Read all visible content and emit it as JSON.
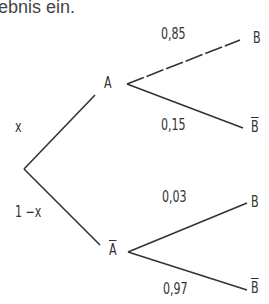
{
  "intro_text": "ebnis ein.",
  "tree": {
    "level1": {
      "edges": [
        {
          "from": "root",
          "to": "A",
          "prob": "x"
        },
        {
          "from": "root",
          "to": "A_bar",
          "prob": "1 −x"
        }
      ],
      "nodes": {
        "A": "A",
        "A_bar": "A"
      }
    },
    "level2": {
      "edges": [
        {
          "from": "A",
          "to": "B",
          "prob": "0,85"
        },
        {
          "from": "A",
          "to": "B_bar",
          "prob": "0,15"
        },
        {
          "from": "A_bar",
          "to": "B",
          "prob": "0,03"
        },
        {
          "from": "A_bar",
          "to": "B_bar",
          "prob": "0,97"
        }
      ],
      "nodes": {
        "B1": "B",
        "Bbar1": "B",
        "B2": "B",
        "Bbar2": "B"
      }
    }
  },
  "colors": {
    "line": "#333333",
    "text": "#333333"
  }
}
